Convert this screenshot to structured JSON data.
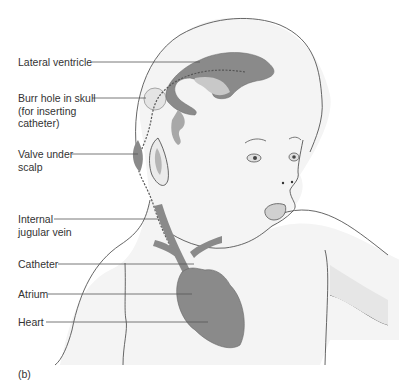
{
  "figure": {
    "panel_label": "(b)",
    "labels": [
      {
        "id": "lateral-ventricle",
        "lines": [
          "Lateral ventricle"
        ]
      },
      {
        "id": "burr-hole",
        "lines": [
          "Burr hole in skull",
          "(for inserting",
          "catheter)"
        ]
      },
      {
        "id": "valve",
        "lines": [
          "Valve under",
          "scalp"
        ]
      },
      {
        "id": "jugular-vein",
        "lines": [
          "Internal",
          "jugular vein"
        ]
      },
      {
        "id": "catheter",
        "lines": [
          "Catheter"
        ]
      },
      {
        "id": "atrium",
        "lines": [
          "Atrium"
        ]
      },
      {
        "id": "heart",
        "lines": [
          "Heart"
        ]
      }
    ],
    "colors": {
      "outline": "#555555",
      "skin_fill": "#f4f4f4",
      "organ_dark": "#8a8a8a",
      "organ_mid": "#a8a8a8",
      "organ_light": "#c8c8c8",
      "text": "#333333"
    }
  }
}
